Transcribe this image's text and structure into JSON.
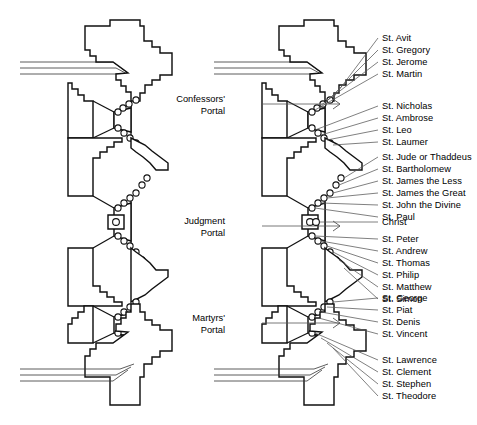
{
  "figure": {
    "type": "architectural-ground-plan",
    "panels": [
      {
        "name": "unlabeled-plan",
        "annotated": false
      },
      {
        "name": "annotated-plan",
        "annotated": true
      }
    ]
  },
  "portals": [
    {
      "id": "confessors",
      "line1": "Confessors'",
      "line2": "Portal"
    },
    {
      "id": "judgment",
      "line1": "Judgment",
      "line2": "Portal"
    },
    {
      "id": "martyrs",
      "line1": "Martyrs'",
      "line2": "Portal"
    }
  ],
  "statue_groups": [
    {
      "id": "confessors-left",
      "labels": [
        "St. Avit",
        "St. Gregory",
        "St. Jerome",
        "St. Martin"
      ]
    },
    {
      "id": "confessors-right",
      "labels": [
        "St. Nicholas",
        "St. Ambrose",
        "St. Leo",
        "St. Laumer"
      ]
    },
    {
      "id": "judgment-left",
      "labels": [
        "St. Jude or Thaddeus",
        "St. Bartholomew",
        "St. James the Less",
        "St. James the Great",
        "St. John the Divine",
        "St. Paul"
      ]
    },
    {
      "id": "judgment-trumeau",
      "labels": [
        "Christ"
      ]
    },
    {
      "id": "judgment-right",
      "labels": [
        "St. Peter",
        "St. Andrew",
        "St. Thomas",
        "St. Philip",
        "St. Matthew",
        "St. Simon"
      ]
    },
    {
      "id": "martyrs-left",
      "labels": [
        "St. George",
        "St. Piat",
        "St. Denis",
        "St. Vincent"
      ]
    },
    {
      "id": "martyrs-right",
      "labels": [
        "St. Lawrence",
        "St. Clement",
        "St. Stephen",
        "St. Theodore"
      ]
    }
  ],
  "colors": {
    "background": "#ffffff",
    "wall_stroke": "#111111",
    "leader_stroke": "#555555",
    "text": "#000000"
  }
}
